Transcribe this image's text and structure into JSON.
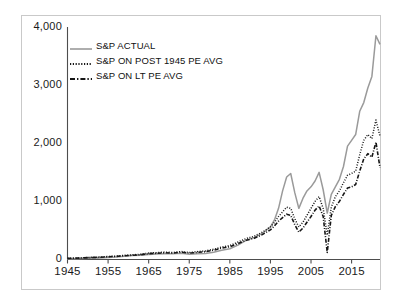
{
  "chart_data": {
    "type": "line",
    "title": "",
    "xlabel": "",
    "ylabel": "",
    "xlim": [
      1945,
      2022
    ],
    "ylim": [
      0,
      4000
    ],
    "grid": false,
    "legend_position": "upper-left",
    "x_tick_labels": [
      "1945",
      "1955",
      "1965",
      "1975",
      "1985",
      "1995",
      "2005",
      "2015"
    ],
    "x_ticks": [
      1945,
      1955,
      1965,
      1975,
      1985,
      1995,
      2005,
      2015
    ],
    "y_tick_labels": [
      "0",
      "1,000",
      "2,000",
      "3,000",
      "4,000"
    ],
    "y_ticks": [
      0,
      1000,
      2000,
      3000,
      4000
    ],
    "x": [
      1945,
      1947,
      1949,
      1951,
      1953,
      1955,
      1957,
      1959,
      1961,
      1963,
      1965,
      1967,
      1969,
      1971,
      1973,
      1975,
      1977,
      1979,
      1981,
      1983,
      1985,
      1987,
      1989,
      1991,
      1993,
      1995,
      1996,
      1997,
      1998,
      1999,
      2000,
      2001,
      2002,
      2003,
      2004,
      2005,
      2006,
      2007,
      2008,
      2009,
      2010,
      2011,
      2012,
      2013,
      2014,
      2015,
      2016,
      2017,
      2018,
      2019,
      2020,
      2021,
      2022
    ],
    "series": [
      {
        "name": "S&P ACTUAL",
        "style": "solid",
        "color": "#9a9a9a",
        "values": [
          15,
          15,
          16,
          22,
          25,
          35,
          42,
          57,
          67,
          72,
          88,
          93,
          100,
          99,
          108,
          90,
          99,
          102,
          125,
          160,
          185,
          247,
          330,
          380,
          450,
          560,
          680,
          880,
          1180,
          1420,
          1480,
          1150,
          880,
          1050,
          1180,
          1250,
          1350,
          1500,
          1200,
          800,
          1120,
          1250,
          1380,
          1600,
          1950,
          2050,
          2150,
          2550,
          2700,
          2950,
          3150,
          3850,
          3700
        ]
      },
      {
        "name": "S&P ON POST 1945 PE AVG",
        "style": "dotted",
        "color": "#161616",
        "values": [
          22,
          25,
          30,
          38,
          42,
          52,
          58,
          72,
          80,
          90,
          110,
          118,
          128,
          120,
          138,
          120,
          135,
          148,
          175,
          215,
          240,
          300,
          360,
          400,
          470,
          560,
          640,
          740,
          820,
          900,
          880,
          700,
          560,
          640,
          760,
          880,
          1000,
          1080,
          880,
          420,
          900,
          1080,
          1180,
          1320,
          1450,
          1480,
          1520,
          1800,
          2050,
          2150,
          2080,
          2400,
          2120
        ]
      },
      {
        "name": "S&P ON LT PE AVG",
        "style": "dashdot",
        "color": "#161616",
        "values": [
          20,
          23,
          28,
          35,
          38,
          48,
          53,
          65,
          73,
          82,
          100,
          108,
          116,
          110,
          126,
          110,
          122,
          134,
          160,
          196,
          220,
          275,
          330,
          365,
          428,
          510,
          580,
          660,
          720,
          780,
          760,
          600,
          470,
          540,
          640,
          740,
          850,
          920,
          740,
          120,
          760,
          910,
          1000,
          1120,
          1230,
          1250,
          1290,
          1520,
          1730,
          1820,
          1760,
          2020,
          1580
        ]
      }
    ]
  },
  "legend": {
    "items": [
      {
        "label": "S&P ACTUAL",
        "style": "solid",
        "color": "#9a9a9a"
      },
      {
        "label": "S&P ON POST 1945 PE AVG",
        "style": "dotted",
        "color": "#161616"
      },
      {
        "label": "S&P ON LT PE AVG",
        "style": "dashdot",
        "color": "#161616"
      }
    ]
  },
  "axes": {
    "axis_color": "#4d4d4d",
    "frame_color": "#c9c9c9",
    "background": "#ffffff"
  }
}
